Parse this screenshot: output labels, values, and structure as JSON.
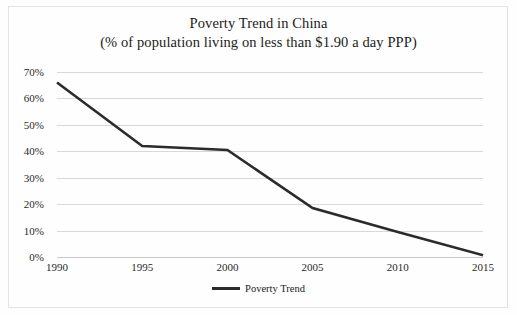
{
  "figure": {
    "title_line1": "Poverty Trend in China",
    "title_line2": "(% of population living on less than $1.90 a day PPP)"
  },
  "legend": {
    "label": "Poverty Trend",
    "marker": "line-swatch-icon",
    "position": "bottom-center"
  },
  "axis": {
    "y_ticks": [
      "0%",
      "10%",
      "20%",
      "30%",
      "40%",
      "50%",
      "60%",
      "70%"
    ],
    "x_ticks": [
      "1990",
      "1995",
      "2000",
      "2005",
      "2010",
      "2015"
    ]
  },
  "colors": {
    "series_line": "#2b2b2b",
    "gridline": "#d8d8d8",
    "baseline": "#c9c9c9",
    "page_border": "#e3e3e3",
    "text": "#1b1b1b",
    "background": "#fefefe"
  },
  "chart_data": {
    "type": "line",
    "title": "Poverty Trend in China (% of population living on less than $1.90 a day PPP)",
    "xlabel": "",
    "ylabel": "",
    "x": [
      1990,
      1995,
      2000,
      2005,
      2010,
      2015
    ],
    "categories": [
      "1990",
      "1995",
      "2000",
      "2005",
      "2010",
      "2015"
    ],
    "series": [
      {
        "name": "Poverty Trend",
        "values": [
          66.0,
          42.0,
          40.5,
          18.5,
          9.5,
          0.7
        ],
        "color": "#2b2b2b"
      }
    ],
    "xlim": [
      1990,
      2015
    ],
    "ylim": [
      0,
      70
    ],
    "ytick_values": [
      0,
      10,
      20,
      30,
      40,
      50,
      60,
      70
    ],
    "ytick_labels": [
      "0%",
      "10%",
      "20%",
      "30%",
      "40%",
      "50%",
      "60%",
      "70%"
    ],
    "xtick_values": [
      1990,
      1995,
      2000,
      2005,
      2010,
      2015
    ],
    "xtick_labels": [
      "1990",
      "1995",
      "2000",
      "2005",
      "2010",
      "2015"
    ],
    "grid": "horizontal",
    "legend_position": "bottom-center",
    "units": "percent of population"
  }
}
